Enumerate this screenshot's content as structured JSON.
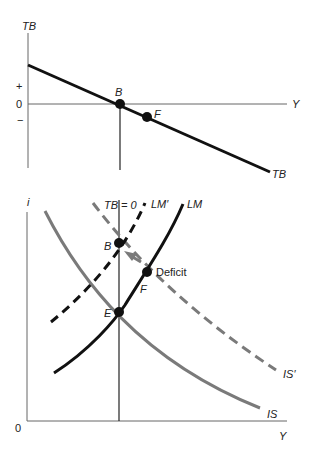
{
  "top_panel": {
    "y_axis_label": "TB",
    "x_axis_label": "Y",
    "plus_label": "+",
    "zero_label": "0",
    "minus_label": "−",
    "curve_label": "TB",
    "point_b_label": "B",
    "point_f_label": "F"
  },
  "bottom_panel": {
    "y_axis_label": "i",
    "x_axis_label": "Y",
    "origin_label": "0",
    "tb0_label": "TB = 0",
    "lm_prime_label": "LM′",
    "lm_label": "LM",
    "is_prime_label": "IS′",
    "is_label": "IS",
    "point_b_label": "B",
    "point_f_label": "F",
    "point_e_label": "E",
    "deficit_label": "Deficit"
  },
  "colors": {
    "axis": "#555555",
    "black_curve": "#111111",
    "gray_curve": "#7a7a7a"
  }
}
